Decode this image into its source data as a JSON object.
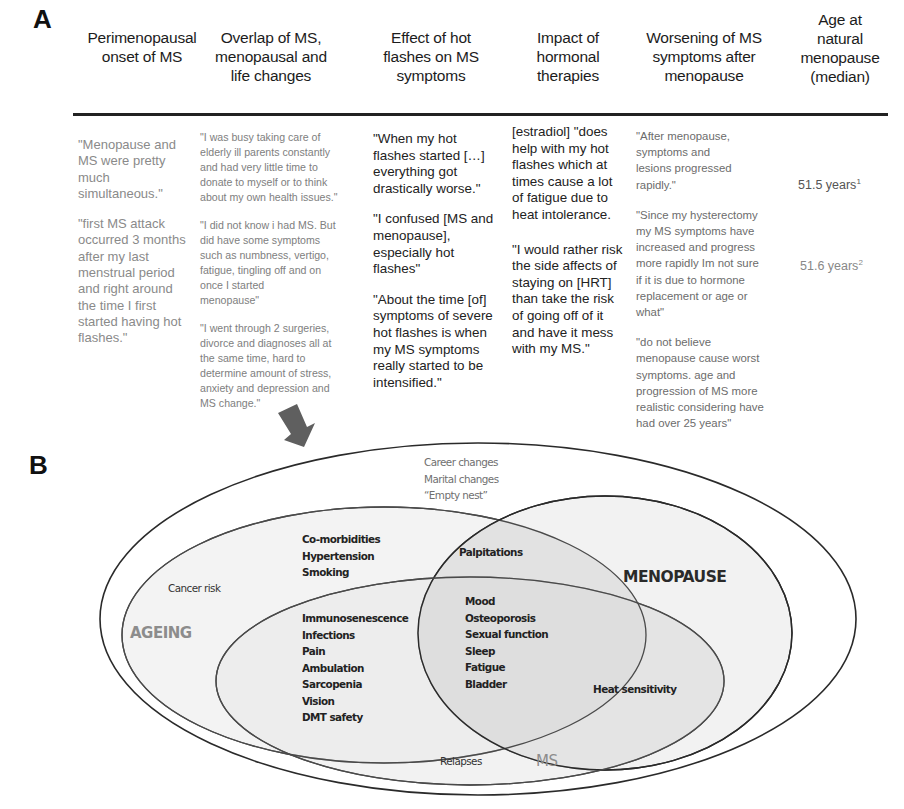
{
  "panel_a": {
    "label": "A",
    "columns": [
      {
        "header": "Perimenopausal\nonset of MS",
        "quotes": [
          "\"Menopause and\nMS were pretty\nmuch\nsimultaneous.\"",
          "\"first MS attack\noccurred 3 months\nafter my last\nmenstrual period\nand right around\nthe time I first\nstarted having hot\nflashes.\""
        ]
      },
      {
        "header": "Overlap of MS,\nmenopausal and\nlife changes",
        "quotes": [
          "\"I was busy taking care of\nelderly ill parents constantly\nand had very little time to\ndonate to myself or to think\nabout my own health issues.\"",
          "\"I did not know i had MS. But\ndid have some symptoms\nsuch as numbness, vertigo,\nfatigue, tingling off and on\nonce I started\nmenopause\"",
          "\"I went through 2 surgeries,\ndivorce and diagnoses all at\nthe same time, hard to\ndetermine amount of stress,\nanxiety and depression and\nMS change.\""
        ]
      },
      {
        "header": "Effect of hot\nflashes on MS\nsymptoms",
        "quotes": [
          "\"When my hot\nflashes started […]\neverything got\ndrastically worse.\"",
          "\"I confused [MS and\nmenopause],\nespecially hot\nflashes\"",
          "\"About the time [of]\nsymptoms of severe\nhot flashes is when\nmy MS symptoms\nreally started to be\nintensified.\""
        ]
      },
      {
        "header": "Impact of\nhormonal\ntherapies",
        "quotes": [
          "[estradiol] \"does\nhelp with my hot\nflashes which at\ntimes cause a lot\nof fatigue due to\nheat intolerance.",
          "\"I would rather risk\nthe side affects of\nstaying on [HRT]\nthan take the risk\nof going off of it\nand have it mess\nwith my MS.\""
        ]
      },
      {
        "header": "Worsening of MS\nsymptoms after\nmenopause",
        "quotes": [
          "\"After menopause,\nsymptoms and\nlesions progressed\nrapidly.\"",
          "\"Since my hysterectomy\nmy MS symptoms have\nincreased and progress\nmore rapidly Im not sure\nif it is due to hormone\nreplacement or age or\nwhat\"",
          "\"do not believe\nmenopause cause worst\nsymptoms. age and\nprogression of MS more\nrealistic considering have\nhad over 25 years\""
        ]
      },
      {
        "header": "Age at\nnatural\nmenopause\n(median)",
        "values": [
          {
            "text": "51.5 years",
            "sup": "1"
          },
          {
            "text": "51.6 years",
            "sup": "2"
          }
        ]
      }
    ]
  },
  "arrow": {
    "icon": "down-right-arrow-icon",
    "color": "#5f5f5f"
  },
  "panel_b": {
    "label": "B",
    "sets": {
      "ageing": "AGEING",
      "menopause": "MENOPAUSE",
      "ms": "MS"
    },
    "life_changes": "Career changes\nMarital changes\n“Empty nest”",
    "ageing_only": [
      "Co-morbidities\nHypertension\nSmoking",
      "Cancer risk"
    ],
    "ageing_menopause": "Palpitations",
    "ageing_ms": "Immunosenescence\nInfections\nPain\nAmbulation\nSarcopenia\nVision\nDMT safety",
    "all_three": "Mood\nOsteoporosis\nSexual function\nSleep\nFatigue\nBladder",
    "menopause_ms": "Heat  sensitivity",
    "ms_only": "Relapses",
    "colors": {
      "outline": "#2a2a2a",
      "fill_light": "#f1f1f1",
      "fill_mid": "#e4e4e4",
      "fill_dark": "#d6d6d6",
      "set_label": "#8c8c8c"
    }
  }
}
